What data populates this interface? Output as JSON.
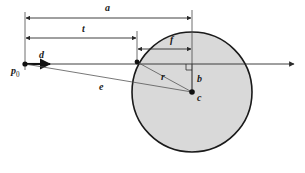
{
  "figure": {
    "kind": "ray-sphere-intersection-diagram",
    "background_color": "#ffffff",
    "line_color": "#2b2b2b",
    "thin_line_color": "#555555",
    "circle_fill_color": "#d9d9d9",
    "circle_stroke_color": "#1a1a1a",
    "labels": {
      "origin": "p",
      "origin_subscript": "0",
      "direction": "d",
      "dist_a": "a",
      "dist_t": "t",
      "dist_f": "f",
      "dist_b": "b",
      "radius": "r",
      "vector_e": "e",
      "center": "c"
    }
  },
  "geometry": {
    "origin_point": {
      "x": 25,
      "y": 64
    },
    "direction_arrow_end": {
      "x": 52,
      "y": 64
    },
    "ray_arrow_end": {
      "x": 296,
      "y": 64
    },
    "hit_point": {
      "x": 137,
      "y": 62
    },
    "center_point": {
      "x": 192,
      "y": 92
    },
    "foot_point": {
      "x": 192,
      "y": 64
    },
    "circle": {
      "cx": 192,
      "cy": 92,
      "r": 60
    },
    "dim_a": {
      "y": 18,
      "x_from": 25,
      "x_to": 192
    },
    "dim_t": {
      "y": 38,
      "x_from": 25,
      "x_to": 137
    },
    "dim_f": {
      "y": 49,
      "x_from": 137,
      "x_to": 192
    },
    "extension_lines": [
      {
        "x": 25,
        "y_from": 12,
        "y_to": 68
      },
      {
        "x": 137,
        "y_from": 32,
        "y_to": 63
      },
      {
        "x": 192,
        "y_from": 10,
        "y_to": 92
      }
    ]
  }
}
